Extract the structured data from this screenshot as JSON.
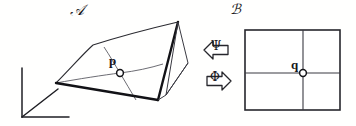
{
  "figure": {
    "title": "",
    "stroke_color": "#1a1a1e",
    "thin_stroke_color": "#55555c",
    "background": "#ffffff",
    "manifold_left": {
      "name_label": "ℬ-source",
      "label": "𝒜",
      "point_label": "p",
      "point_marker": "open-circle",
      "description": "curved surface patch with coordinate grid"
    },
    "manifold_right": {
      "label": "ℬ",
      "point_label": "q",
      "point_marker": "open-circle",
      "description": "flat rectangular chart with coordinate grid"
    },
    "maps": {
      "upper": {
        "label": "Ψ",
        "direction": "left",
        "icon": "block-arrow-left-icon"
      },
      "lower": {
        "label": "Φ",
        "direction": "right",
        "icon": "block-arrow-right-icon"
      }
    },
    "axes": {
      "icon": "coordinate-axes-icon",
      "axis_count": 3,
      "labels": []
    }
  }
}
